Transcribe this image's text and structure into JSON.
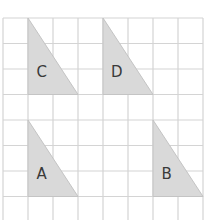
{
  "grid": {
    "columns": 8,
    "rows": 8,
    "origin_x": 3,
    "origin_y": 18,
    "cell_w": 25,
    "cell_h": 25.5,
    "line_color": "#d4d4d4",
    "background": "#ffffff"
  },
  "shape_style": {
    "fill": "#d9d9d9",
    "stroke": "#c4c4c4"
  },
  "triangles": [
    {
      "label": "C",
      "vertices": [
        [
          1,
          0
        ],
        [
          1,
          3
        ],
        [
          3,
          3
        ]
      ],
      "label_pos": [
        1.55,
        2.1
      ]
    },
    {
      "label": "D",
      "vertices": [
        [
          4,
          0
        ],
        [
          4,
          3
        ],
        [
          6,
          3
        ]
      ],
      "label_pos": [
        4.55,
        2.1
      ]
    },
    {
      "label": "A",
      "vertices": [
        [
          1,
          4
        ],
        [
          1,
          7
        ],
        [
          3,
          7
        ]
      ],
      "label_pos": [
        1.55,
        6.1
      ]
    },
    {
      "label": "B",
      "vertices": [
        [
          6,
          4
        ],
        [
          6,
          7
        ],
        [
          8,
          7
        ]
      ],
      "label_pos": [
        6.55,
        6.1
      ]
    }
  ]
}
